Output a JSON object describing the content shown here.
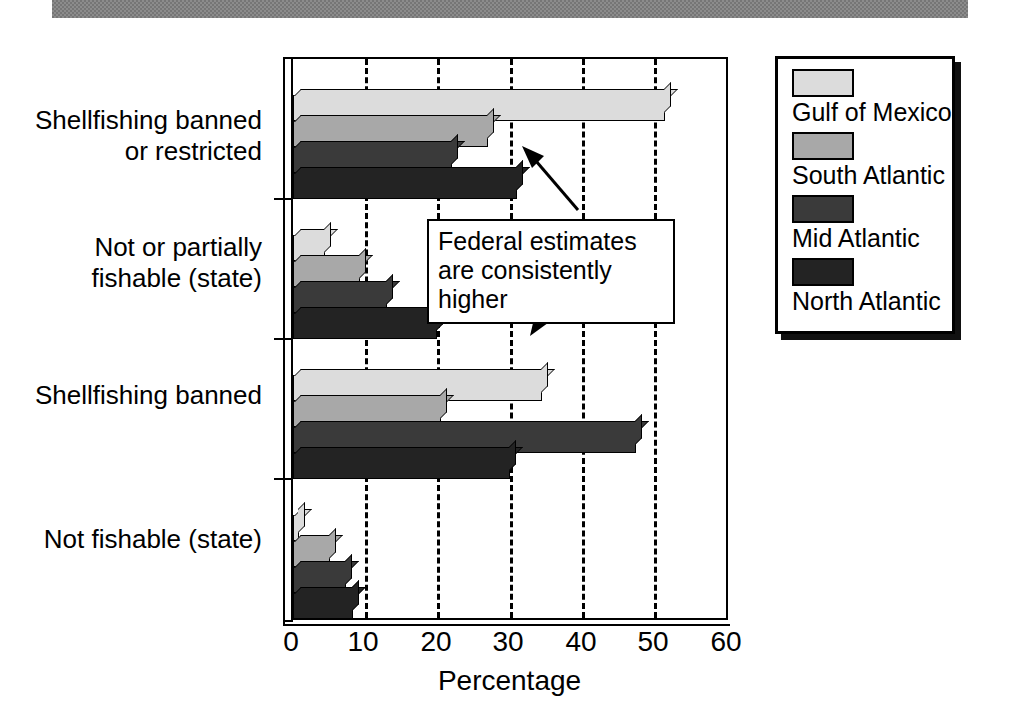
{
  "chart_data": {
    "type": "bar",
    "orientation": "horizontal",
    "title": "",
    "xlabel": "Percentage",
    "ylabel": "",
    "xlim": [
      0,
      60
    ],
    "xticks": [
      0,
      10,
      20,
      30,
      40,
      50,
      60
    ],
    "xticklabels": [
      "0",
      "10",
      "20",
      "30",
      "40",
      "50",
      "60"
    ],
    "grid": "vertical dashed gridlines at 10, 20, 30, 40, 50",
    "legend_position": "right",
    "categories": [
      "Shellfishing banned or restricted",
      "Not or partially fishable (state)",
      "Shellfishing banned",
      "Not fishable (state)"
    ],
    "series": [
      {
        "name": "Gulf of Mexico",
        "color": "#dcdcdc",
        "values": [
          51.5,
          4.4,
          34.5,
          0.8
        ]
      },
      {
        "name": "South Atlantic",
        "color": "#a8a8a8",
        "values": [
          27.0,
          9.3,
          20.5,
          5.1
        ]
      },
      {
        "name": "Mid Atlantic",
        "color": "#3a3a3a",
        "values": [
          22.0,
          13.0,
          47.5,
          7.4
        ]
      },
      {
        "name": "North Atlantic",
        "color": "#232323",
        "values": [
          31.0,
          20.0,
          30.0,
          8.3
        ]
      }
    ],
    "annotations": [
      {
        "text_line1": "Federal estimates",
        "text_line2": "are consistently higher",
        "arrows": 2
      }
    ]
  },
  "axis": {
    "tick_0": "0",
    "tick_10": "10",
    "tick_20": "20",
    "tick_30": "30",
    "tick_40": "40",
    "tick_50": "50",
    "tick_60": "60",
    "title": "Percentage"
  },
  "categories": {
    "c0_line1": "Shellfishing banned",
    "c0_line2": "or restricted",
    "c1_line1": "Not or partially",
    "c1_line2": "fishable (state)",
    "c2_line1": "Shellfishing banned",
    "c3_line1": "Not fishable (state)"
  },
  "legend": {
    "items": [
      {
        "label": "Gulf of Mexico"
      },
      {
        "label": "South Atlantic"
      },
      {
        "label": "Mid Atlantic"
      },
      {
        "label": "North Atlantic"
      }
    ]
  },
  "annotation": {
    "line1": "Federal estimates",
    "line2": "are consistently higher"
  }
}
